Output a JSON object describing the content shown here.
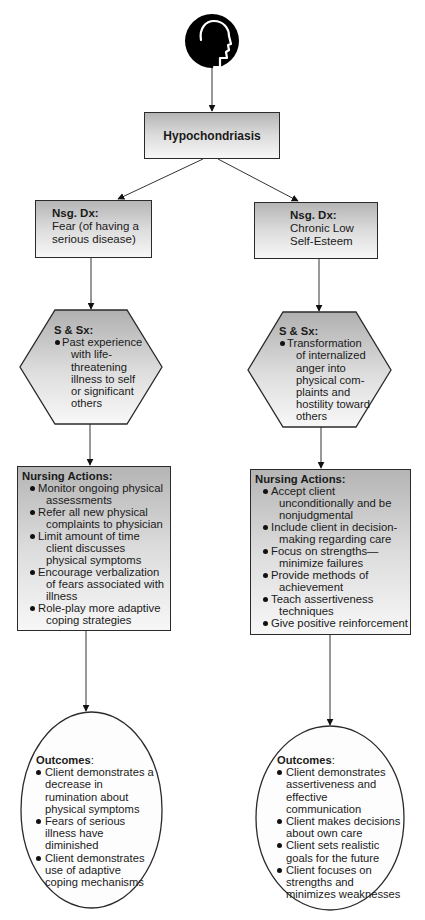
{
  "diagram": {
    "root_icon": "head-profile-icon",
    "root_title": "Hypochondriasis",
    "colors": {
      "stroke": "#2a2a2a",
      "fill_top": "#b5b5b5",
      "fill_bottom": "#f7f7f7",
      "icon_bg": "#000000"
    },
    "branches": [
      {
        "diagnosis": {
          "heading": "Nsg. Dx:",
          "lines": [
            "Fear (of having a",
            "serious disease)"
          ]
        },
        "signs": {
          "heading": "S & Sx:",
          "items": [
            "Past experience with life-threatening illness to self or significant others"
          ],
          "lines": [
            "Past experience",
            "with life-",
            "threatening",
            "illness to self",
            "or significant",
            "others"
          ]
        },
        "nursing_actions": {
          "heading": "Nursing Actions:",
          "items": [
            "Monitor ongoing physical assessments",
            "Refer all new physical complaints to physician",
            "Limit amount of time client discusses physical symptoms",
            "Encourage verbalization of fears associated with illness",
            "Role-play more adaptive coping strategies"
          ]
        },
        "outcomes": {
          "heading": "Outcomes",
          "items": [
            "Client demonstrates a decrease in rumination about physical symptoms",
            "Fears of serious illness have diminished",
            "Client demonstrates use of adaptive coping mechanisms"
          ]
        }
      },
      {
        "diagnosis": {
          "heading": "Nsg. Dx:",
          "lines": [
            "Chronic Low",
            "Self-Esteem"
          ]
        },
        "signs": {
          "heading": "S & Sx:",
          "items": [
            "Transformation of internalized anger into physical complaints and hostility toward others"
          ],
          "lines": [
            "Transformation",
            "of internalized",
            "anger into",
            "physical com-",
            "plaints and",
            "hostility toward",
            "others"
          ]
        },
        "nursing_actions": {
          "heading": "Nursing Actions:",
          "items": [
            "Accept client unconditionally and be nonjudgmental",
            "Include client in decision-making regarding care",
            "Focus on strengths—minimize failures",
            "Provide methods of achievement",
            "Teach assertiveness techniques",
            "Give positive reinforcement"
          ]
        },
        "outcomes": {
          "heading": "Outcomes",
          "items": [
            "Client demonstrates assertiveness and effective communication",
            "Client makes decisions about own care",
            "Client sets realistic goals for the future",
            "Client focuses on strengths and minimizes weaknesses"
          ]
        }
      }
    ]
  }
}
